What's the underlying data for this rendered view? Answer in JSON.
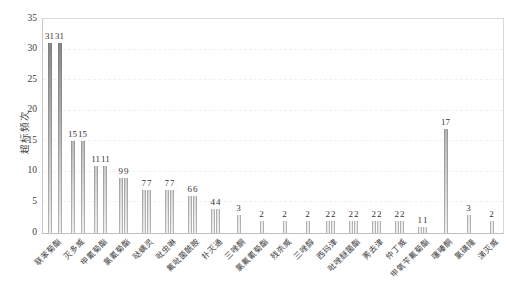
{
  "chart_data": {
    "type": "bar",
    "title": "",
    "xlabel": "",
    "ylabel": "超标频次",
    "ylim": [
      0,
      35
    ],
    "yticks": [
      0,
      5,
      10,
      15,
      20,
      25,
      30,
      35
    ],
    "grid": "faint dashed horizontal",
    "legend": "none",
    "bars": [
      {
        "label": "联苯菊酯",
        "values": [
          31,
          31
        ]
      },
      {
        "label": "灭多威",
        "values": [
          15,
          15
        ]
      },
      {
        "label": "甲氰菊酯",
        "values": [
          11,
          11
        ]
      },
      {
        "label": "氯氰菊酯",
        "values": [
          9,
          9
        ]
      },
      {
        "label": "哒螨灵",
        "values": [
          7,
          7
        ]
      },
      {
        "label": "吡虫啉",
        "values": [
          7,
          7
        ]
      },
      {
        "label": "氟吡菌酰胺",
        "values": [
          6,
          6
        ]
      },
      {
        "label": "扑灭通",
        "values": [
          4,
          4
        ]
      },
      {
        "label": "三唑酮",
        "values": [
          3
        ]
      },
      {
        "label": "氯氟氰菊酯",
        "values": [
          2
        ]
      },
      {
        "label": "残杀威",
        "values": [
          2
        ]
      },
      {
        "label": "三唑醇",
        "values": [
          2
        ]
      },
      {
        "label": "西玛津",
        "values": [
          2,
          2
        ]
      },
      {
        "label": "吡唑醚菌酯",
        "values": [
          2,
          2
        ]
      },
      {
        "label": "莠去津",
        "values": [
          2,
          2
        ]
      },
      {
        "label": "仲丁威",
        "values": [
          2,
          2
        ]
      },
      {
        "label": "甲氧苄氟菊酯",
        "values": [
          1,
          1
        ]
      },
      {
        "label": "噻嗪酮",
        "values": [
          17
        ]
      },
      {
        "label": "氯磺隆",
        "values": [
          3
        ]
      },
      {
        "label": "涕灭威",
        "values": [
          2
        ]
      }
    ]
  },
  "colors": {
    "background": "#ffffff",
    "bar_gradient_top": "#7a7a7a",
    "bar_gradient_bottom": "#ededed",
    "plot_border": "#d9d9d9",
    "axis_line": "#bfbfbf",
    "gridline": "#f0f0f0",
    "text": "#404040"
  }
}
